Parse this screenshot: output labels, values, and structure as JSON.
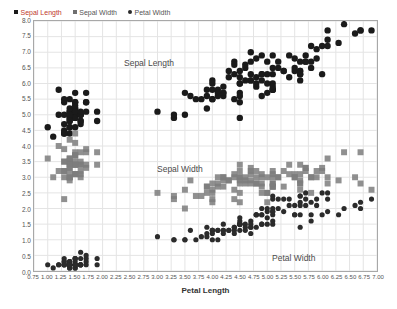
{
  "chart_data": {
    "type": "scatter",
    "title": "",
    "xlabel": "Petal Length",
    "ylabel": "",
    "xlim": [
      0.75,
      7.0
    ],
    "ylim": [
      0.0,
      8.0
    ],
    "grid": true,
    "legend_position": "top-left",
    "xticks": [
      "0.75",
      "1.00",
      "1.25",
      "1.50",
      "1.75",
      "2.00",
      "2.25",
      "2.50",
      "2.75",
      "3.00",
      "3.25",
      "3.50",
      "3.75",
      "4.00",
      "4.25",
      "4.50",
      "4.75",
      "5.00",
      "5.25",
      "5.50",
      "5.75",
      "6.00",
      "6.25",
      "6.50",
      "6.75",
      "7.00"
    ],
    "yticks": [
      "0.0",
      "0.5",
      "1.0",
      "1.5",
      "2.0",
      "2.5",
      "3.0",
      "3.5",
      "4.0",
      "4.5",
      "5.0",
      "5.5",
      "6.0",
      "6.5",
      "7.0",
      "7.5",
      "8.0"
    ],
    "annotations": [
      {
        "text": "Sepal Length",
        "x": 3.3,
        "y": 6.9
      },
      {
        "text": "Sepal Width",
        "x": 3.9,
        "y": 3.6
      },
      {
        "text": "Petal Width",
        "x": 5.9,
        "y": 0.85
      }
    ],
    "series": [
      {
        "name": "Sepal Length",
        "marker": "circle",
        "color": "#1a1a1a",
        "size": 3.2,
        "x": [
          1.4,
          1.4,
          1.3,
          1.5,
          1.4,
          1.7,
          1.4,
          1.5,
          1.4,
          1.5,
          1.5,
          1.6,
          1.4,
          1.1,
          1.2,
          1.5,
          1.3,
          1.4,
          1.7,
          1.5,
          1.7,
          1.5,
          1.0,
          1.7,
          1.9,
          1.6,
          1.6,
          1.5,
          1.4,
          1.6,
          1.6,
          1.5,
          1.5,
          1.4,
          1.5,
          1.2,
          1.3,
          1.4,
          1.3,
          1.5,
          1.3,
          1.3,
          1.3,
          1.6,
          1.9,
          1.4,
          1.6,
          1.4,
          1.5,
          1.4,
          4.7,
          4.5,
          4.9,
          4.0,
          4.6,
          4.5,
          4.7,
          3.3,
          4.6,
          3.9,
          3.5,
          4.2,
          4.0,
          4.7,
          3.6,
          4.4,
          4.5,
          4.1,
          4.5,
          3.9,
          4.8,
          4.0,
          4.9,
          4.7,
          4.3,
          4.4,
          4.8,
          5.0,
          4.5,
          3.5,
          3.8,
          3.7,
          3.9,
          5.1,
          4.5,
          4.5,
          4.7,
          4.4,
          4.1,
          4.0,
          4.4,
          4.6,
          4.0,
          3.3,
          4.2,
          4.2,
          4.2,
          4.3,
          3.0,
          4.1,
          6.0,
          5.1,
          5.9,
          5.6,
          5.8,
          6.6,
          4.5,
          6.3,
          5.8,
          6.1,
          5.1,
          5.3,
          5.5,
          5.0,
          5.1,
          5.3,
          5.5,
          6.7,
          6.9,
          5.0,
          5.7,
          4.9,
          6.7,
          4.9,
          5.7,
          6.0,
          4.8,
          4.9,
          5.6,
          5.8,
          6.1,
          6.4,
          5.6,
          5.1,
          5.6,
          6.1,
          5.6,
          5.5,
          4.8,
          5.4,
          5.6,
          5.1,
          5.1,
          5.9,
          5.7,
          5.2,
          5.0,
          5.2,
          5.4,
          5.1
        ],
        "y": [
          5.1,
          4.9,
          4.7,
          4.6,
          5.0,
          5.4,
          4.6,
          5.0,
          4.4,
          4.9,
          5.4,
          4.8,
          4.8,
          4.3,
          5.8,
          5.7,
          5.4,
          5.1,
          5.7,
          5.1,
          5.4,
          5.1,
          4.6,
          5.1,
          4.8,
          5.0,
          5.0,
          5.2,
          5.2,
          4.7,
          4.8,
          5.4,
          5.2,
          5.5,
          4.9,
          5.0,
          5.5,
          4.9,
          4.4,
          5.1,
          5.0,
          4.5,
          4.4,
          5.0,
          5.1,
          4.8,
          5.1,
          4.6,
          5.3,
          5.0,
          7.0,
          6.4,
          6.9,
          5.5,
          6.5,
          5.7,
          6.3,
          4.9,
          6.6,
          5.2,
          5.0,
          5.9,
          6.0,
          6.1,
          5.6,
          6.7,
          5.6,
          5.8,
          6.2,
          5.6,
          5.9,
          6.1,
          6.3,
          6.1,
          6.4,
          6.6,
          6.8,
          6.7,
          6.0,
          5.7,
          5.5,
          5.5,
          5.8,
          6.0,
          5.4,
          6.0,
          6.7,
          6.3,
          5.6,
          5.5,
          5.5,
          6.1,
          5.8,
          5.0,
          5.6,
          5.7,
          5.7,
          6.2,
          5.1,
          5.7,
          6.3,
          5.8,
          7.1,
          6.3,
          6.5,
          7.6,
          4.9,
          7.3,
          6.7,
          7.2,
          6.5,
          6.4,
          6.8,
          5.7,
          5.8,
          6.4,
          6.5,
          7.7,
          7.7,
          6.0,
          6.9,
          5.6,
          7.7,
          6.3,
          6.7,
          7.2,
          6.2,
          6.1,
          6.4,
          7.2,
          7.4,
          7.9,
          6.4,
          6.3,
          6.1,
          7.7,
          6.3,
          6.4,
          6.0,
          6.9,
          6.7,
          6.9,
          5.8,
          6.8,
          6.7,
          6.7,
          6.3,
          6.5,
          6.2,
          5.9
        ]
      },
      {
        "name": "Sepal Width",
        "marker": "square",
        "color": "#7d7d7d",
        "size": 3.0,
        "x": [
          1.4,
          1.4,
          1.3,
          1.5,
          1.4,
          1.7,
          1.4,
          1.5,
          1.4,
          1.5,
          1.5,
          1.6,
          1.4,
          1.1,
          1.2,
          1.5,
          1.3,
          1.4,
          1.7,
          1.5,
          1.7,
          1.5,
          1.0,
          1.7,
          1.9,
          1.6,
          1.6,
          1.5,
          1.4,
          1.6,
          1.6,
          1.5,
          1.5,
          1.4,
          1.5,
          1.2,
          1.3,
          1.4,
          1.3,
          1.5,
          1.3,
          1.3,
          1.3,
          1.6,
          1.9,
          1.4,
          1.6,
          1.4,
          1.5,
          1.4,
          4.7,
          4.5,
          4.9,
          4.0,
          4.6,
          4.5,
          4.7,
          3.3,
          4.6,
          3.9,
          3.5,
          4.2,
          4.0,
          4.7,
          3.6,
          4.4,
          4.5,
          4.1,
          4.5,
          3.9,
          4.8,
          4.0,
          4.9,
          4.7,
          4.3,
          4.4,
          4.8,
          5.0,
          4.5,
          3.5,
          3.8,
          3.7,
          3.9,
          5.1,
          4.5,
          4.5,
          4.7,
          4.4,
          4.1,
          4.0,
          4.4,
          4.6,
          4.0,
          3.3,
          4.2,
          4.2,
          4.2,
          4.3,
          3.0,
          4.1,
          6.0,
          5.1,
          5.9,
          5.6,
          5.8,
          6.6,
          4.5,
          6.3,
          5.8,
          6.1,
          5.1,
          5.3,
          5.5,
          5.0,
          5.1,
          5.3,
          5.5,
          6.7,
          6.9,
          5.0,
          5.7,
          4.9,
          6.7,
          4.9,
          5.7,
          6.0,
          4.8,
          4.9,
          5.6,
          5.8,
          6.1,
          6.4,
          5.6,
          5.1,
          5.6,
          6.1,
          5.6,
          5.5,
          4.8,
          5.4,
          5.6,
          5.1,
          5.1,
          5.9,
          5.7,
          5.2,
          5.0,
          5.2,
          5.4,
          5.1
        ],
        "y": [
          3.5,
          3.0,
          3.2,
          3.1,
          3.6,
          3.9,
          3.4,
          3.4,
          2.9,
          3.1,
          3.7,
          3.4,
          3.0,
          3.0,
          4.0,
          4.4,
          3.9,
          3.5,
          3.8,
          3.8,
          3.4,
          3.7,
          3.6,
          3.3,
          3.4,
          3.0,
          3.4,
          3.5,
          3.4,
          3.2,
          3.1,
          3.4,
          4.1,
          4.2,
          3.1,
          3.2,
          3.5,
          3.6,
          3.0,
          3.4,
          3.5,
          2.3,
          3.2,
          3.5,
          3.8,
          3.0,
          3.8,
          3.2,
          3.7,
          3.3,
          3.2,
          3.2,
          3.1,
          2.3,
          2.8,
          2.8,
          3.3,
          2.4,
          2.9,
          2.7,
          2.0,
          3.0,
          2.2,
          2.9,
          2.9,
          3.1,
          3.0,
          2.7,
          2.2,
          2.5,
          3.2,
          2.8,
          2.5,
          2.8,
          2.9,
          3.0,
          2.8,
          3.0,
          2.9,
          2.6,
          2.4,
          2.4,
          2.7,
          2.7,
          3.0,
          3.4,
          3.1,
          2.3,
          3.0,
          2.5,
          2.6,
          3.0,
          2.6,
          2.3,
          2.7,
          3.0,
          2.9,
          2.9,
          2.5,
          2.8,
          3.3,
          2.7,
          3.0,
          2.9,
          3.0,
          3.0,
          2.5,
          2.9,
          2.5,
          3.6,
          3.2,
          2.7,
          3.0,
          2.5,
          2.8,
          3.2,
          3.0,
          3.8,
          2.6,
          2.2,
          3.2,
          2.8,
          2.8,
          2.7,
          3.3,
          3.2,
          2.8,
          3.0,
          2.8,
          3.0,
          2.8,
          3.8,
          2.8,
          2.8,
          2.6,
          3.0,
          3.4,
          3.1,
          3.0,
          3.1,
          3.1,
          3.1,
          2.7,
          3.2,
          3.3,
          3.0,
          2.5,
          3.0,
          3.4,
          3.0
        ]
      },
      {
        "name": "Petal Width",
        "marker": "circle",
        "color": "#2b2b2b",
        "size": 2.6,
        "x": [
          1.4,
          1.4,
          1.3,
          1.5,
          1.4,
          1.7,
          1.4,
          1.5,
          1.4,
          1.5,
          1.5,
          1.6,
          1.4,
          1.1,
          1.2,
          1.5,
          1.3,
          1.4,
          1.7,
          1.5,
          1.7,
          1.5,
          1.0,
          1.7,
          1.9,
          1.6,
          1.6,
          1.5,
          1.4,
          1.6,
          1.6,
          1.5,
          1.5,
          1.4,
          1.5,
          1.2,
          1.3,
          1.4,
          1.3,
          1.5,
          1.3,
          1.3,
          1.3,
          1.6,
          1.9,
          1.4,
          1.6,
          1.4,
          1.5,
          1.4,
          4.7,
          4.5,
          4.9,
          4.0,
          4.6,
          4.5,
          4.7,
          3.3,
          4.6,
          3.9,
          3.5,
          4.2,
          4.0,
          4.7,
          3.6,
          4.4,
          4.5,
          4.1,
          4.5,
          3.9,
          4.8,
          4.0,
          4.9,
          4.7,
          4.3,
          4.4,
          4.8,
          5.0,
          4.5,
          3.5,
          3.8,
          3.7,
          3.9,
          5.1,
          4.5,
          4.5,
          4.7,
          4.4,
          4.1,
          4.0,
          4.4,
          4.6,
          4.0,
          3.3,
          4.2,
          4.2,
          4.2,
          4.3,
          3.0,
          4.1,
          6.0,
          5.1,
          5.9,
          5.6,
          5.8,
          6.6,
          4.5,
          6.3,
          5.8,
          6.1,
          5.1,
          5.3,
          5.5,
          5.0,
          5.1,
          5.3,
          5.5,
          6.7,
          6.9,
          5.0,
          5.7,
          4.9,
          6.7,
          4.9,
          5.7,
          6.0,
          4.8,
          4.9,
          5.6,
          5.8,
          6.1,
          6.4,
          5.6,
          5.1,
          5.6,
          6.1,
          5.6,
          5.5,
          4.8,
          5.4,
          5.6,
          5.1,
          5.1,
          5.9,
          5.7,
          5.2,
          5.0,
          5.2,
          5.4,
          5.1
        ],
        "y": [
          0.2,
          0.2,
          0.2,
          0.2,
          0.2,
          0.4,
          0.3,
          0.2,
          0.2,
          0.1,
          0.2,
          0.2,
          0.1,
          0.1,
          0.2,
          0.4,
          0.4,
          0.3,
          0.3,
          0.3,
          0.2,
          0.4,
          0.2,
          0.5,
          0.2,
          0.2,
          0.4,
          0.2,
          0.2,
          0.2,
          0.2,
          0.4,
          0.1,
          0.2,
          0.2,
          0.2,
          0.2,
          0.1,
          0.2,
          0.2,
          0.3,
          0.3,
          0.2,
          0.6,
          0.4,
          0.3,
          0.2,
          0.2,
          0.2,
          0.2,
          1.4,
          1.5,
          1.5,
          1.3,
          1.5,
          1.3,
          1.6,
          1.0,
          1.3,
          1.4,
          1.0,
          1.5,
          1.0,
          1.4,
          1.3,
          1.4,
          1.5,
          1.0,
          1.5,
          1.1,
          1.8,
          1.3,
          1.5,
          1.2,
          1.3,
          1.4,
          1.4,
          1.7,
          1.5,
          1.0,
          1.1,
          1.0,
          1.2,
          1.6,
          1.5,
          1.6,
          1.5,
          1.3,
          1.3,
          1.3,
          1.2,
          1.4,
          1.2,
          1.0,
          1.3,
          1.2,
          1.3,
          1.3,
          1.1,
          1.3,
          2.5,
          1.9,
          2.1,
          1.8,
          2.2,
          2.1,
          1.7,
          1.8,
          1.8,
          2.5,
          2.0,
          1.9,
          2.1,
          2.0,
          2.4,
          2.3,
          1.8,
          2.2,
          2.3,
          1.5,
          2.3,
          2.0,
          2.0,
          1.8,
          2.1,
          1.8,
          1.8,
          1.8,
          2.1,
          1.6,
          1.9,
          2.0,
          2.2,
          1.5,
          1.4,
          2.3,
          2.4,
          1.8,
          1.8,
          2.1,
          2.4,
          2.3,
          1.9,
          2.3,
          2.5,
          2.3,
          1.9,
          2.0,
          2.3,
          1.8
        ]
      }
    ]
  },
  "legend": {
    "items": [
      {
        "label": "Sepal Length",
        "marker": "square",
        "color": "#1a1a1a",
        "text_color": "#c0392b"
      },
      {
        "label": "Sepal Width",
        "marker": "square",
        "color": "#6f6f6f",
        "text_color": "#555555"
      },
      {
        "label": "Petal Width",
        "marker": "circle",
        "color": "#2b2b2b",
        "text_color": "#555555"
      }
    ]
  },
  "axes": {
    "x_title": "Petal Length"
  },
  "style": {
    "grid_color": "#e4e4e4",
    "frame_color": "#a8a8a8",
    "background": "#ffffff"
  }
}
